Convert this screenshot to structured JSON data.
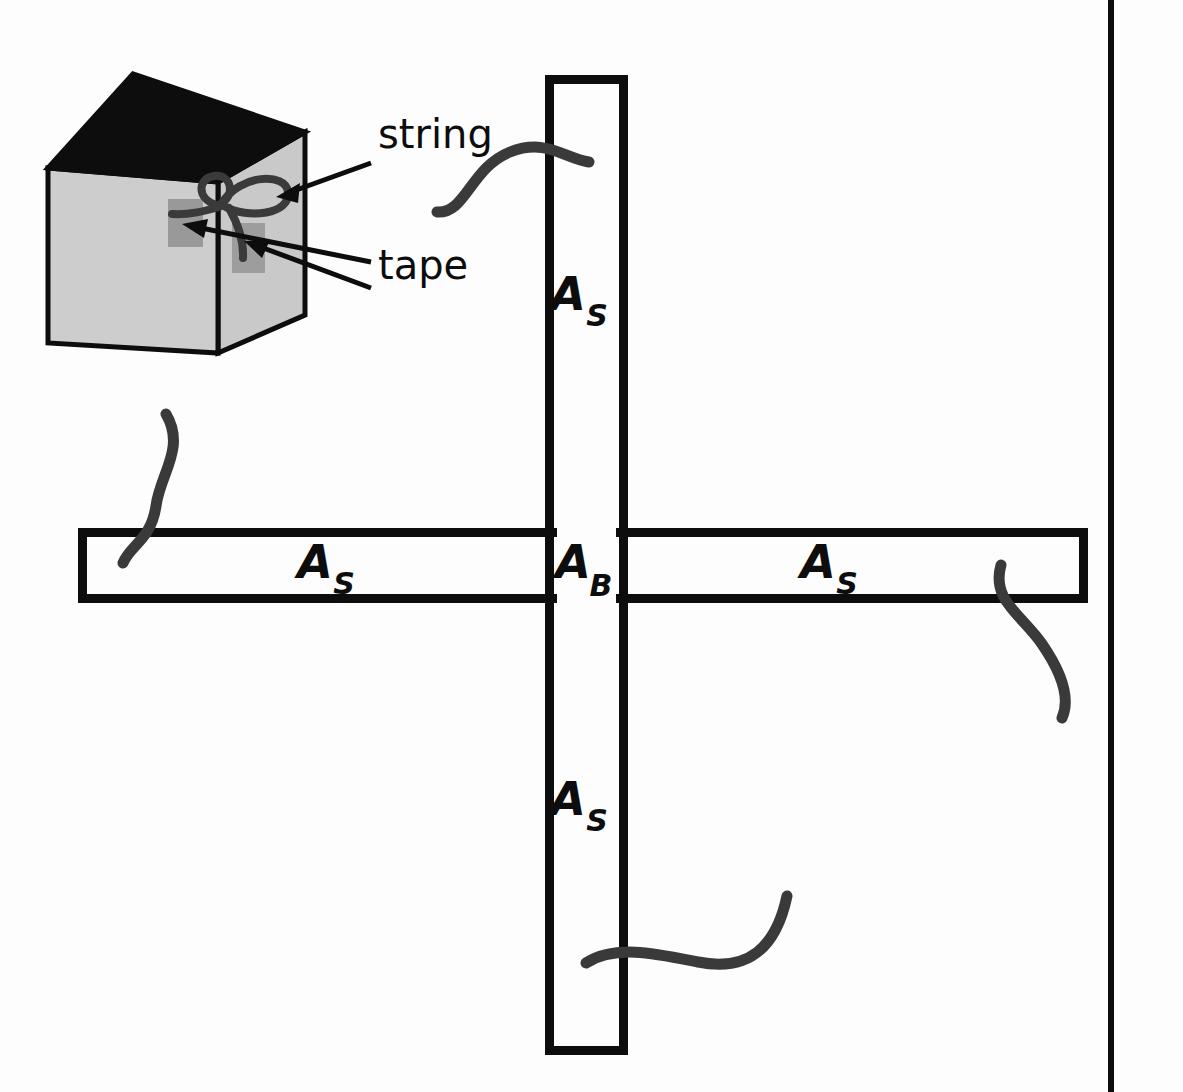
{
  "figure": {
    "kind": "physics-apparatus-diagram",
    "background_color": "#fdfdfd",
    "ink_color": "#0d0d0d",
    "string_color": "#3a3a3a"
  },
  "cube_inset": {
    "name": "weight-block",
    "face_color": "#cccccc",
    "top_face_color": "#0d0d0d",
    "tape_color": "#999999",
    "outline_color": "#0d0d0d",
    "tape_patch_count": 2
  },
  "callouts": [
    {
      "id": "string",
      "label": "string",
      "label_x": 378,
      "label_y": 148,
      "leader_from_x": 371,
      "leader_from_y": 163,
      "leader_to_x": 279,
      "leader_to_y": 196
    },
    {
      "id": "tape",
      "label": "tape",
      "label_x": 378,
      "label_y": 279,
      "leader_from_x": 371,
      "leader_from_y": 262,
      "leader_to_x": 186,
      "leader_to_y": 224,
      "leader2_from_x": 371,
      "leader2_from_y": 287,
      "leader2_to_x": 247,
      "leader2_to_y": 243
    }
  ],
  "strips": {
    "vertical": {
      "name": "vertical-strip",
      "left": 545,
      "right": 628,
      "top": 75,
      "bottom": 1055,
      "stroke_width": 9,
      "labels": [
        {
          "id": "vertical-upper",
          "main": "A",
          "sub": "S",
          "x": 586,
          "y": 310
        },
        {
          "id": "vertical-lower",
          "main": "A",
          "sub": "S",
          "x": 586,
          "y": 815
        }
      ]
    },
    "horizontal": {
      "name": "horizontal-strip",
      "left": 78,
      "right": 1088,
      "top": 528,
      "bottom": 603,
      "stroke_width": 9,
      "labels": [
        {
          "id": "horizontal-left",
          "main": "A",
          "sub": "S",
          "x": 330,
          "y": 573
        },
        {
          "id": "horizontal-right",
          "main": "A",
          "sub": "S",
          "x": 830,
          "y": 573
        }
      ]
    },
    "junction": {
      "name": "junction-block",
      "main": "A",
      "sub": "B",
      "x": 586,
      "y": 573
    }
  },
  "strings": [
    {
      "id": "string-top",
      "name": "string-top-vertical"
    },
    {
      "id": "string-left",
      "name": "string-left-horizontal"
    },
    {
      "id": "string-right",
      "name": "string-right-horizontal"
    },
    {
      "id": "string-bottom",
      "name": "string-bottom-vertical"
    },
    {
      "id": "string-knot",
      "name": "string-knot-on-block"
    }
  ],
  "page_border": {
    "name": "page-edge-rule",
    "x": 1108,
    "width": 6
  }
}
